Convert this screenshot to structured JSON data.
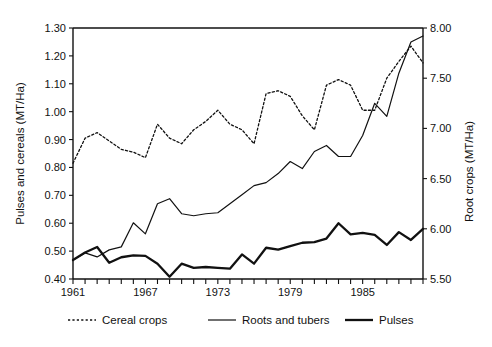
{
  "chart_data": {
    "type": "line",
    "title": "",
    "xlabel": "",
    "ylabel": "Pulses and cereals (MT/Ha)",
    "y2label": "Root crops (MT/Ha)",
    "grid": false,
    "legend_position": "bottom",
    "xlim": [
      1961,
      1990
    ],
    "ylim": [
      0.4,
      1.3
    ],
    "y2lim": [
      5.5,
      8.0
    ],
    "yticks": [
      "0.40",
      "0.50",
      "0.60",
      "0.70",
      "0.80",
      "0.90",
      "1.00",
      "1.10",
      "1.20",
      "1.30"
    ],
    "ytick_values": [
      0.4,
      0.5,
      0.6,
      0.7,
      0.8,
      0.9,
      1.0,
      1.1,
      1.2,
      1.3
    ],
    "y2ticks": [
      "5.50",
      "6.00",
      "6.50",
      "7.00",
      "7.50",
      "8.00"
    ],
    "y2tick_values": [
      5.5,
      6.0,
      6.5,
      7.0,
      7.5,
      8.0
    ],
    "xticks": [
      "1961",
      "1967",
      "1973",
      "1979",
      "1985"
    ],
    "xtick_values": [
      1961,
      1967,
      1973,
      1979,
      1985
    ],
    "x": [
      1961,
      1962,
      1963,
      1964,
      1965,
      1966,
      1967,
      1968,
      1969,
      1970,
      1971,
      1972,
      1973,
      1974,
      1975,
      1976,
      1977,
      1978,
      1979,
      1980,
      1981,
      1982,
      1983,
      1984,
      1985,
      1986,
      1987,
      1988,
      1989,
      1990
    ],
    "series": [
      {
        "name": "Cereal crops",
        "axis": "left",
        "style": "dotted",
        "values": [
          0.815,
          0.905,
          0.925,
          0.895,
          0.865,
          0.855,
          0.835,
          0.955,
          0.905,
          0.885,
          0.935,
          0.965,
          1.005,
          0.955,
          0.935,
          0.885,
          1.065,
          1.075,
          1.055,
          0.985,
          0.935,
          1.095,
          1.115,
          1.095,
          1.005,
          1.005,
          1.12,
          1.18,
          1.235,
          1.175
        ]
      },
      {
        "name": "Roots and tubers",
        "axis": "right",
        "style": "solid-thin",
        "values": [
          5.69,
          5.76,
          5.72,
          5.79,
          5.82,
          6.06,
          5.95,
          6.25,
          6.3,
          6.15,
          6.13,
          6.15,
          6.16,
          6.25,
          6.34,
          6.43,
          6.46,
          6.55,
          6.67,
          6.6,
          6.77,
          6.83,
          6.72,
          6.72,
          6.93,
          7.25,
          7.12,
          7.55,
          7.86,
          7.92
        ]
      },
      {
        "name": "Pulses",
        "axis": "left",
        "style": "solid-thick",
        "values": [
          0.468,
          0.495,
          0.515,
          0.458,
          0.478,
          0.485,
          0.483,
          0.455,
          0.408,
          0.455,
          0.44,
          0.443,
          0.44,
          0.437,
          0.488,
          0.455,
          0.512,
          0.505,
          0.518,
          0.53,
          0.532,
          0.545,
          0.6,
          0.56,
          0.565,
          0.558,
          0.522,
          0.568,
          0.54,
          0.58
        ]
      }
    ]
  },
  "legend": {
    "items": [
      {
        "label": "Cereal crops",
        "style": "dotted"
      },
      {
        "label": "Roots and tubers",
        "style": "solid-thin"
      },
      {
        "label": "Pulses",
        "style": "solid-thick"
      }
    ]
  }
}
